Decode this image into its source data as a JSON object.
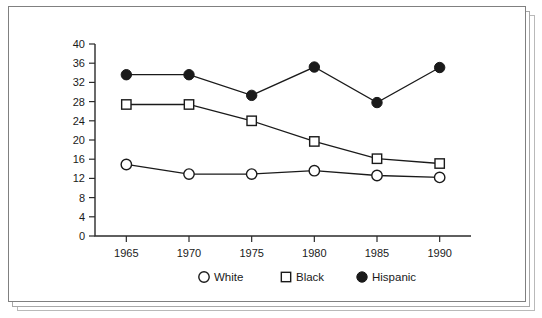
{
  "figure": {
    "background_color": "#ffffff",
    "frame_color": "#808080",
    "ink_color": "#1a1a1a"
  },
  "chart_data": {
    "type": "line",
    "title": "",
    "subtitle": "",
    "xlabel": "",
    "ylabel": "",
    "categories": [
      "1965",
      "1970",
      "1975",
      "1980",
      "1985",
      "1990"
    ],
    "x": [
      1965,
      1970,
      1975,
      1980,
      1985,
      1990
    ],
    "xlim": [
      1962.5,
      1992.5
    ],
    "ylim": [
      0,
      40
    ],
    "yticks": [
      0,
      4,
      8,
      12,
      16,
      20,
      24,
      28,
      32,
      36,
      40
    ],
    "xticks": [
      1965,
      1970,
      1975,
      1980,
      1985,
      1990
    ],
    "grid": false,
    "legend_position": "bottom",
    "series": [
      {
        "name": "White",
        "marker": "open-circle",
        "marker_fill": "#ffffff",
        "marker_stroke": "#1a1a1a",
        "line_color": "#1a1a1a",
        "values": [
          14.9,
          12.9,
          12.9,
          13.6,
          12.6,
          12.2
        ]
      },
      {
        "name": "Black",
        "marker": "open-square",
        "marker_fill": "#ffffff",
        "marker_stroke": "#1a1a1a",
        "line_color": "#1a1a1a",
        "values": [
          27.4,
          27.4,
          24.0,
          19.7,
          16.1,
          15.1
        ]
      },
      {
        "name": "Hispanic",
        "marker": "filled-circle",
        "marker_fill": "#1a1a1a",
        "marker_stroke": "#1a1a1a",
        "line_color": "#1a1a1a",
        "values": [
          33.6,
          33.6,
          29.3,
          35.2,
          27.8,
          35.1
        ]
      }
    ]
  },
  "axis": {
    "y_tick_labels": [
      "40",
      "36",
      "32",
      "28",
      "24",
      "20",
      "16",
      "12",
      "8",
      "4",
      "0"
    ],
    "x_tick_labels": [
      "1965",
      "1970",
      "1975",
      "1980",
      "1985",
      "1990"
    ]
  },
  "legend": {
    "items": [
      {
        "label": "White",
        "marker": "open-circle"
      },
      {
        "label": "Black",
        "marker": "open-square"
      },
      {
        "label": "Hispanic",
        "marker": "filled-circle"
      }
    ]
  }
}
